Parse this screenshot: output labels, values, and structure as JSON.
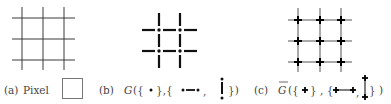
{
  "figure": {
    "panels": [
      {
        "id": "a",
        "label": "(a)",
        "caption_text": "Pixel",
        "caption_symbol": "square",
        "grid": {
          "xs": [
            22,
            43,
            64
          ],
          "ys": [
            18,
            39,
            60
          ],
          "x_range": [
            12,
            75
          ],
          "y_range": [
            7,
            70
          ],
          "style": "continuous-lines",
          "node_marker": "none"
        }
      },
      {
        "id": "b",
        "label": "(b)",
        "caption_func": "G",
        "caption_open": "({",
        "caption_mid1": "},{",
        "caption_sep": ",",
        "caption_close": "})",
        "caption_symbols": [
          "dot",
          "horizontal-dumbbell",
          "vertical-dumbbell"
        ],
        "grid": {
          "xs": [
            159,
            180
          ],
          "ys": [
            30,
            51
          ],
          "x_range": [
            142,
            197
          ],
          "y_range": [
            13,
            68
          ],
          "style": "broken-segments",
          "node_marker": "dot"
        }
      },
      {
        "id": "c",
        "label": "(c)",
        "caption_func": "G",
        "caption_func_overline": true,
        "caption_open": "({",
        "caption_mid1": "} , {",
        "caption_sep": ",",
        "caption_close": "} )",
        "caption_symbols": [
          "plus-node",
          "horizontal-plus-edge",
          "vertical-plus-edge"
        ],
        "grid": {
          "xs": [
            298,
            320,
            341
          ],
          "ys": [
            20,
            41,
            62
          ],
          "x_range": [
            288,
            352
          ],
          "y_range": [
            8,
            72
          ],
          "style": "continuous-lines",
          "node_marker": "plus"
        }
      }
    ],
    "colors": {
      "line": "#3a3a3a",
      "light_line": "#777777",
      "text": "#444444",
      "background": "#ffffff"
    }
  }
}
